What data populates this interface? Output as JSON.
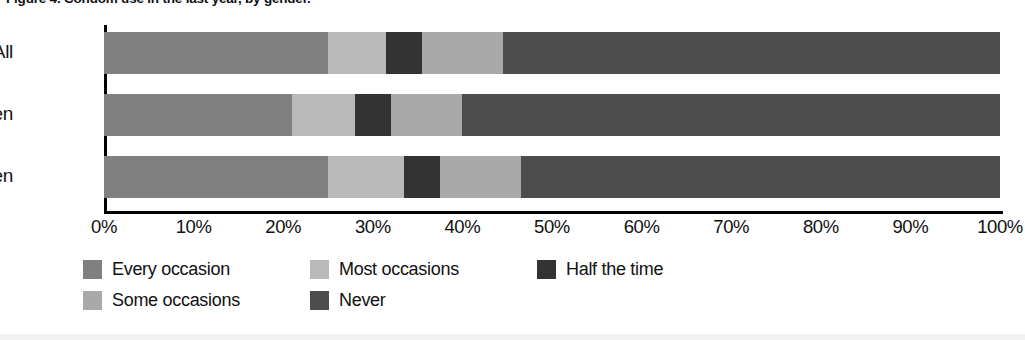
{
  "figure": {
    "title": "Figure 4. Condom use in the last year, by gender."
  },
  "chart_data": {
    "type": "bar",
    "orientation": "horizontal",
    "stacked": true,
    "stack_mode": "percent",
    "title": "Figure 4. Condom use in the last year, by gender.",
    "xlabel": "",
    "ylabel": "",
    "xlim": [
      0,
      100
    ],
    "xtick_labels": [
      "0%",
      "10%",
      "20%",
      "30%",
      "40%",
      "50%",
      "60%",
      "70%",
      "80%",
      "90%",
      "100%"
    ],
    "xtick_values": [
      0,
      10,
      20,
      30,
      40,
      50,
      60,
      70,
      80,
      90,
      100
    ],
    "grid": false,
    "legend_position": "bottom-left",
    "categories": [
      "All",
      "Women",
      "Men"
    ],
    "series": [
      {
        "name": "Every occasion",
        "color": "#808080",
        "values": [
          25.0,
          21.0,
          25.0
        ]
      },
      {
        "name": "Most occasions",
        "color": "#b9b9b9",
        "values": [
          6.5,
          7.0,
          8.5
        ]
      },
      {
        "name": "Half the time",
        "color": "#333333",
        "values": [
          4.0,
          4.0,
          4.0
        ]
      },
      {
        "name": "Some occasions",
        "color": "#a9a9a9",
        "values": [
          9.0,
          8.0,
          9.0
        ]
      },
      {
        "name": "Never",
        "color": "#4d4d4d",
        "values": [
          55.5,
          60.0,
          53.5
        ]
      }
    ],
    "legend": [
      {
        "label": "Every occasion",
        "color": "#808080"
      },
      {
        "label": "Most occasions",
        "color": "#b9b9b9"
      },
      {
        "label": "Half the time",
        "color": "#333333"
      },
      {
        "label": "Some occasions",
        "color": "#a9a9a9"
      },
      {
        "label": "Never",
        "color": "#4d4d4d"
      }
    ]
  }
}
